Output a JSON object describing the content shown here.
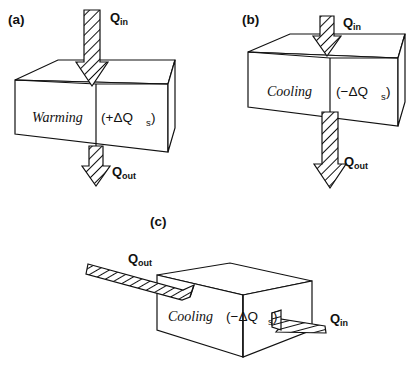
{
  "figure": {
    "background_color": "#ffffff",
    "line_color": "#111111"
  },
  "panels": [
    {
      "id": "a",
      "label": "(a)",
      "state": "Warming",
      "storage": "(+ΔQ",
      "storage_sub": "s",
      "storage_close": ")",
      "storage_full": "(+ΔQₛ)",
      "inflow_label": "Q",
      "inflow_sub": "in",
      "outflow_label": "Q",
      "outflow_sub": "out",
      "inflow_magnitude": "large",
      "outflow_magnitude": "small",
      "net_storage_sign": "positive",
      "orientation": "vertical"
    },
    {
      "id": "b",
      "label": "(b)",
      "state": "Cooling",
      "storage": "(−ΔQ",
      "storage_sub": "s",
      "storage_close": ")",
      "storage_full": "(−ΔQₛ)",
      "inflow_label": "Q",
      "inflow_sub": "in",
      "outflow_label": "Q",
      "outflow_sub": "out",
      "inflow_magnitude": "small",
      "outflow_magnitude": "large",
      "net_storage_sign": "negative",
      "orientation": "vertical"
    },
    {
      "id": "c",
      "label": "(c)",
      "state": "Cooling",
      "storage": "(−ΔQ",
      "storage_sub": "s",
      "storage_close": ")",
      "storage_full": "(−ΔQₛ)",
      "inflow_label": "Q",
      "inflow_sub": "in",
      "outflow_label": "Q",
      "outflow_sub": "out",
      "inflow_magnitude": "small",
      "outflow_magnitude": "large",
      "net_storage_sign": "negative",
      "orientation": "horizontal"
    }
  ],
  "symbols": {
    "delta": "Δ",
    "minus": "−",
    "plus": "+"
  }
}
